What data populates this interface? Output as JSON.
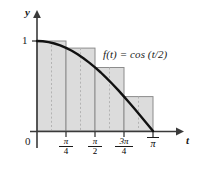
{
  "chart_data": {
    "type": "area",
    "title": "",
    "subtitle": "",
    "xlabel": "t",
    "ylabel": "y",
    "function_label": "f(t) = cos (t/2)",
    "curve_expression": "cos(t/2)",
    "xlim": [
      0,
      3.9269908
    ],
    "ylim": [
      0,
      1.18
    ],
    "x_tick_labels": [
      "0",
      "π/4",
      "π/2",
      "3π/4",
      "π"
    ],
    "x_tick_values": [
      0,
      0.7853982,
      1.5707963,
      2.3561945,
      3.1415927
    ],
    "x_tick_numerators": [
      "",
      "π",
      "π",
      "3π",
      "π"
    ],
    "x_tick_denominators": [
      "",
      "4",
      "2",
      "4",
      ""
    ],
    "y_tick_labels": [
      "1"
    ],
    "y_tick_values": [
      1
    ],
    "grid": false,
    "legend": "none",
    "origin_label": "0",
    "riemann": {
      "kind": "left-endpoint-rectangles",
      "n": 4,
      "interval": [
        0,
        3.1415927
      ],
      "width": 0.7853982,
      "left_edges": [
        0,
        0.7853982,
        1.5707963,
        2.3561945
      ],
      "right_edges": [
        0.7853982,
        1.5707963,
        2.3561945,
        3.1415927
      ],
      "heights": [
        1,
        0.9238795,
        0.7071068,
        0.3826834
      ],
      "midpoints": [
        0.3926991,
        1.1780972,
        1.9634954,
        2.7488936
      ],
      "fill_color": "#dcdcdc",
      "edge_color": "#8c8c8c",
      "dashed_color": "#b0b0b0"
    },
    "curve_color": "#111111",
    "axis_color": "#3a3a3a",
    "sample_x": [
      0,
      0.15708,
      0.31416,
      0.47124,
      0.62832,
      0.7854,
      0.94248,
      1.09956,
      1.25664,
      1.41372,
      1.5708,
      1.72788,
      1.88496,
      2.04204,
      2.19911,
      2.35619,
      2.51327,
      2.67035,
      2.82743,
      2.98451,
      3.14159
    ],
    "sample_y": [
      1,
      0.99692,
      0.98769,
      0.97237,
      0.95106,
      0.92388,
      0.89101,
      0.85264,
      0.80902,
      0.76041,
      0.70711,
      0.64945,
      0.58779,
      0.5225,
      0.45399,
      0.38268,
      0.30902,
      0.23345,
      0.15643,
      0.07846,
      0
    ]
  }
}
